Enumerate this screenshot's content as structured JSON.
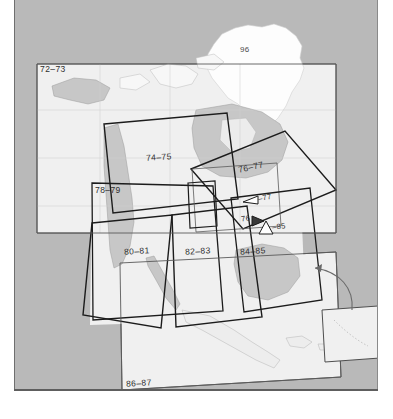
{
  "document": {
    "kind": "atlas-index-map",
    "region_title": "North America",
    "sheet_note": "scanned atlas page index with overlapping map-coverage quadrangles"
  },
  "colors": {
    "page_gray": "#b9b9b9",
    "paper_white": "#ffffff",
    "ocean": "#f2f2f2",
    "land": "#c8c8c8",
    "outline": "#1c1c1c",
    "thin_outline": "#555555",
    "coast": "#9a9a9a",
    "label_text": "#2e2e2e"
  },
  "labels": [
    {
      "id": "l72",
      "text": "72–73",
      "x": 40,
      "y": 69,
      "size": "normal"
    },
    {
      "id": "l96",
      "text": "96",
      "x": 240,
      "y": 50,
      "size": "small"
    },
    {
      "id": "l74",
      "text": "74–75",
      "x": 148,
      "y": 157,
      "size": "normal"
    },
    {
      "id": "l76",
      "text": "76–77",
      "x": 240,
      "y": 167,
      "size": "normal"
    },
    {
      "id": "l78",
      "text": "78–79",
      "x": 97,
      "y": 190,
      "size": "normal"
    },
    {
      "id": "l77c",
      "text": "–77",
      "x": 259,
      "y": 200,
      "size": "small"
    },
    {
      "id": "l76c",
      "text": "76",
      "x": 244,
      "y": 222,
      "size": "small"
    },
    {
      "id": "l85c",
      "text": "–85",
      "x": 274,
      "y": 228,
      "size": "small"
    },
    {
      "id": "l80",
      "text": "80–81",
      "x": 125,
      "y": 251,
      "size": "normal"
    },
    {
      "id": "l82",
      "text": "82–83",
      "x": 186,
      "y": 251,
      "size": "normal"
    },
    {
      "id": "l84",
      "text": "84–85",
      "x": 241,
      "y": 251,
      "size": "normal"
    },
    {
      "id": "l86",
      "text": "86–87",
      "x": 127,
      "y": 383,
      "size": "normal"
    }
  ],
  "quadrangles": [
    {
      "id": "q72-73",
      "label": "72–73",
      "points": "37,64 336,64 336,233 37,233",
      "weight": "thin"
    },
    {
      "id": "q74-75",
      "label": "74–75",
      "points": "104,124 227,113 238,199 113,213",
      "weight": "thick"
    },
    {
      "id": "q76-77",
      "label": "76–77",
      "points": "191,169 285,131 336,190 243,229",
      "weight": "thick"
    },
    {
      "id": "q78-79",
      "label": "78–79",
      "points": "92,183 93,320 223,311 213,186",
      "weight": "thick"
    },
    {
      "id": "q80-81",
      "label": "80–81",
      "points": "92,223 172,215 161,328 83,315",
      "weight": "thick"
    },
    {
      "id": "q82-83",
      "label": "82–83",
      "points": "172,215 247,206 262,317 176,327",
      "weight": "thick"
    },
    {
      "id": "q84-85",
      "label": "84–85",
      "points": "231,198 310,188 322,300 244,312",
      "weight": "thick"
    },
    {
      "id": "q86-87",
      "label": "86–87",
      "points": "120,263 336,253 340,376 122,389",
      "weight": "thin"
    },
    {
      "id": "q-mid-small",
      "label": "",
      "points": "192,169 277,163 281,226 196,232",
      "weight": "thin"
    },
    {
      "id": "q-inner-narrow",
      "label": "",
      "points": "188,183 215,181 217,226 190,228",
      "weight": "thick"
    }
  ],
  "callouts": [
    {
      "id": "c77",
      "text": "–77",
      "shape": "left-pointing-triangle",
      "x": 243,
      "y": 196
    },
    {
      "id": "c76",
      "text": "76",
      "shape": "right-pointing-triangle",
      "x": 253,
      "y": 219
    },
    {
      "id": "c85",
      "text": "–85",
      "shape": "up-pointing-triangle",
      "x": 261,
      "y": 224
    }
  ],
  "inset": {
    "id": "caribbean-inset",
    "points": "322,310 378,306 380,358 325,362",
    "arrow_note": "curved arrow from inset to Caribbean area"
  }
}
